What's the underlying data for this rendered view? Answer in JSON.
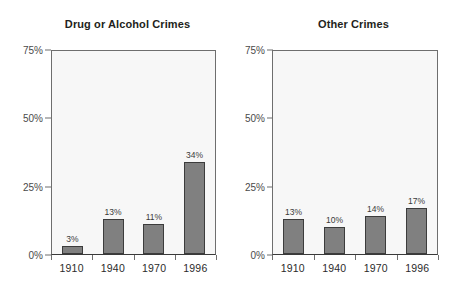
{
  "chart_data": [
    {
      "type": "bar",
      "title": "Drug or Alcohol Crimes",
      "xlabel": "",
      "ylabel": "",
      "categories": [
        "1910",
        "1940",
        "1970",
        "1996"
      ],
      "values": [
        3,
        13,
        11,
        34
      ],
      "value_labels": [
        "3%",
        "13%",
        "11%",
        "34%"
      ],
      "ylim": [
        0,
        75
      ],
      "yticks": [
        0,
        25,
        50,
        75
      ],
      "ytick_labels": [
        "0%",
        "25%",
        "50%",
        "75%"
      ],
      "grid": false,
      "legend": "none",
      "bar_color": "#808080",
      "bar_border_color": "#3c3c3c",
      "plot_background": "#f7f7f7"
    },
    {
      "type": "bar",
      "title": "Other Crimes",
      "xlabel": "",
      "ylabel": "",
      "categories": [
        "1910",
        "1940",
        "1970",
        "1996"
      ],
      "values": [
        13,
        10,
        14,
        17
      ],
      "value_labels": [
        "13%",
        "10%",
        "14%",
        "17%"
      ],
      "ylim": [
        0,
        75
      ],
      "yticks": [
        0,
        25,
        50,
        75
      ],
      "ytick_labels": [
        "0%",
        "25%",
        "50%",
        "75%"
      ],
      "grid": false,
      "legend": "none",
      "bar_color": "#808080",
      "bar_border_color": "#3c3c3c",
      "plot_background": "#f7f7f7"
    }
  ]
}
